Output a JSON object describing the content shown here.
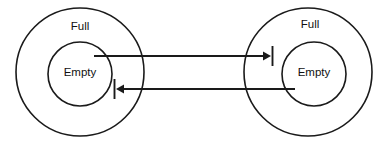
{
  "diagram": {
    "stroke_color": "#1a1a1a",
    "background_color": "#ffffff",
    "text_color": "#111111",
    "nodes": [
      {
        "id": "left-group",
        "outer_label": "Full",
        "inner_label": "Empty",
        "center_x": 80,
        "center_y": 72,
        "outer_radius": 64,
        "inner_radius": 32,
        "outer_label_x": 80,
        "outer_label_y": 27,
        "inner_label_x": 80,
        "inner_label_y": 73
      },
      {
        "id": "right-group",
        "outer_label": "Full",
        "inner_label": "Empty",
        "center_x": 308,
        "center_y": 72,
        "outer_radius": 64,
        "inner_radius": 32,
        "outer_label_x": 310,
        "outer_label_y": 25,
        "inner_label_x": 314,
        "inner_label_y": 73
      }
    ],
    "connectors": [
      {
        "id": "top-connector",
        "direction": "left-to-right",
        "from": "left-inner-circle",
        "to": "right-outer-region",
        "y": 56,
        "start_x": 94,
        "end_x": 265,
        "arrow_x": 265,
        "tick_x": 272,
        "tick_top": 46,
        "tick_bottom": 66
      },
      {
        "id": "bottom-connector",
        "direction": "right-to-left",
        "from": "right-inner-circle",
        "to": "left-outer-region",
        "y": 89,
        "start_x": 295,
        "end_x": 122,
        "arrow_x": 122,
        "tick_x": 115,
        "tick_top": 79,
        "tick_bottom": 99
      }
    ]
  }
}
